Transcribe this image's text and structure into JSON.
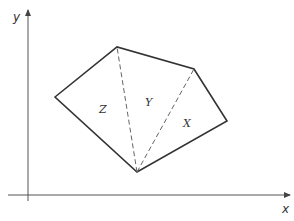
{
  "diagram": {
    "axes": {
      "x_label": "x",
      "y_label": "y"
    },
    "polygon": {
      "vertices": [
        "left",
        "top",
        "upper-right",
        "right",
        "bottom"
      ],
      "stroke_color": "#333333"
    },
    "diagonals": [
      {
        "from": "bottom",
        "to": "top",
        "style": "dashed"
      },
      {
        "from": "bottom",
        "to": "upper-right",
        "style": "dashed"
      }
    ],
    "regions": [
      {
        "label": "Z"
      },
      {
        "label": "Y"
      },
      {
        "label": "X"
      }
    ],
    "colors": {
      "stroke": "#333333",
      "dashed": "#666666",
      "axis": "#555555",
      "background": "#ffffff"
    }
  }
}
